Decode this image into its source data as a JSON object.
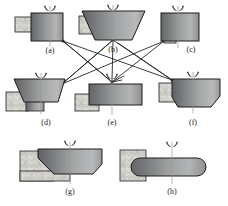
{
  "figure": {
    "type": "engineering-process-diagram",
    "background_color": "#ffffff",
    "body_fill_dark": "#5f6163",
    "body_fill_light": "#b9bbbc",
    "holder_fill": "#d4d2cd",
    "outline_color": "#1c1c1c",
    "connector_color": "#262626",
    "centerline_color": "#9a9a9a",
    "tool_symbol": "chuck-jaws-icon",
    "centerline": "vertical-axis-line"
  },
  "parts": [
    {
      "id": "a",
      "label": "(a)",
      "shape": "rectangular-block",
      "row": 1,
      "has_holder": true,
      "has_tool": true,
      "has_centerline": true
    },
    {
      "id": "b",
      "label": "(b)",
      "shape": "wide-inverted-trapezoid",
      "row": 1,
      "has_holder": true,
      "has_tool": true,
      "has_centerline": true
    },
    {
      "id": "c",
      "label": "(c)",
      "shape": "rectangular-block-with-bottom-stub",
      "row": 1,
      "has_holder": true,
      "has_tool": true,
      "has_centerline": true
    },
    {
      "id": "d",
      "label": "(d)",
      "shape": "inverted-trapezoid-on-step",
      "row": 2,
      "has_holder": true,
      "has_tool": true,
      "has_centerline": true
    },
    {
      "id": "e",
      "label": "(e)",
      "shape": "flat-wide-rectangle",
      "row": 2,
      "has_holder": true,
      "has_tool": true,
      "has_centerline": true
    },
    {
      "id": "f",
      "label": "(f)",
      "shape": "chamfered-block",
      "row": 2,
      "has_holder": true,
      "has_tool": true,
      "has_centerline": true
    },
    {
      "id": "g",
      "label": "(g)",
      "shape": "angled-chamfer-slab",
      "row": 3,
      "has_holder": true,
      "has_tool": true,
      "has_centerline": true
    },
    {
      "id": "h",
      "label": "(h)",
      "shape": "rounded-end-bar",
      "row": 3,
      "has_holder": true,
      "has_tool": true,
      "has_centerline": true
    }
  ],
  "connectors": [
    {
      "from": "a",
      "to": "e"
    },
    {
      "from": "a",
      "to": "f"
    },
    {
      "from": "b",
      "to": "d"
    },
    {
      "from": "b",
      "to": "e"
    },
    {
      "from": "b",
      "to": "f"
    },
    {
      "from": "c",
      "to": "d"
    },
    {
      "from": "c",
      "to": "e"
    },
    {
      "from": "d",
      "to": "b"
    },
    {
      "from": "e",
      "to": "a"
    },
    {
      "from": "f",
      "to": "b"
    }
  ],
  "labels": {
    "a": "(a)",
    "b": "(b)",
    "c": "(c)",
    "d": "(d)",
    "e": "(e)",
    "f": "(f)",
    "g": "(g)",
    "h": "(h)"
  }
}
